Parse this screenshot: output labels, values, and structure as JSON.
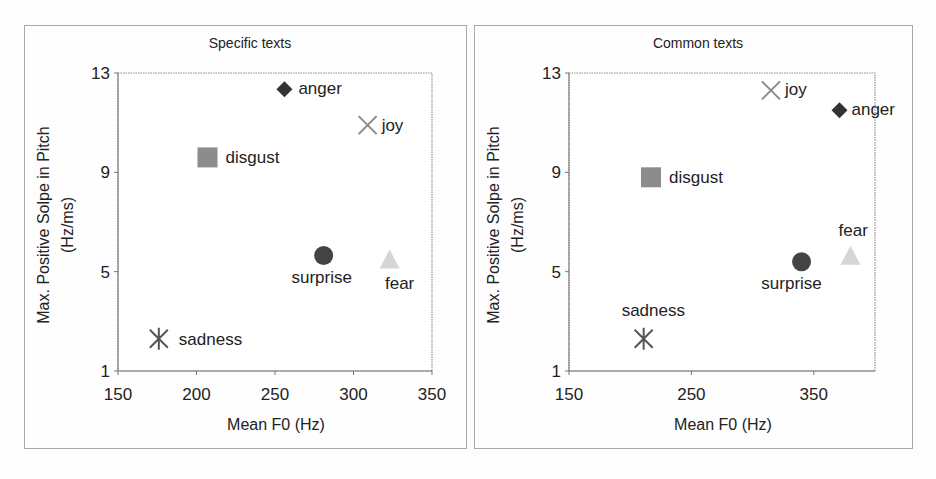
{
  "chart_data": [
    {
      "type": "scatter",
      "title": "Specific texts",
      "xlabel": "Mean F0 (Hz)",
      "ylabel": "Max. Positive Solpe in Pitch (Hz/ms)",
      "ylabel_lines": [
        "Max. Positive Solpe in Pitch",
        "(Hz/ms)"
      ],
      "xlim": [
        150,
        350
      ],
      "ylim": [
        1,
        13
      ],
      "xticks": [
        150,
        200,
        250,
        300,
        350
      ],
      "yticks": [
        1,
        5,
        9,
        13
      ],
      "grid": false,
      "legend": "none (points labeled directly)",
      "points": [
        {
          "label": "anger",
          "x": 256,
          "y": 12.35,
          "marker": "diamond",
          "color": "#333333"
        },
        {
          "label": "joy",
          "x": 309,
          "y": 10.9,
          "marker": "x",
          "color": "#8a8a8a"
        },
        {
          "label": "disgust",
          "x": 207,
          "y": 9.6,
          "marker": "square",
          "color": "#8c8c8c"
        },
        {
          "label": "surprise",
          "x": 281,
          "y": 5.65,
          "marker": "circle",
          "color": "#444444"
        },
        {
          "label": "fear",
          "x": 323,
          "y": 5.45,
          "marker": "triangle",
          "color": "#d6d6d6"
        },
        {
          "label": "sadness",
          "x": 176,
          "y": 2.3,
          "marker": "asterisk",
          "color": "#555555"
        }
      ]
    },
    {
      "type": "scatter",
      "title": "Common texts",
      "xlabel": "Mean F0 (Hz)",
      "ylabel": "Max. Positive Solpe in Pitch (Hz/ms)",
      "ylabel_lines": [
        "Max. Positive Solpe in Pitch",
        "(Hz/ms)"
      ],
      "xlim": [
        150,
        400
      ],
      "ylim": [
        1,
        13
      ],
      "xticks": [
        150,
        250,
        350
      ],
      "yticks": [
        1,
        5,
        9,
        13
      ],
      "grid": false,
      "legend": "none (points labeled directly)",
      "points": [
        {
          "label": "joy",
          "x": 315,
          "y": 12.3,
          "marker": "x",
          "color": "#8a8a8a"
        },
        {
          "label": "anger",
          "x": 371,
          "y": 11.5,
          "marker": "diamond",
          "color": "#333333"
        },
        {
          "label": "disgust",
          "x": 217,
          "y": 8.8,
          "marker": "square",
          "color": "#8c8c8c"
        },
        {
          "label": "surprise",
          "x": 340,
          "y": 5.4,
          "marker": "circle",
          "color": "#444444"
        },
        {
          "label": "fear",
          "x": 380,
          "y": 5.6,
          "marker": "triangle",
          "color": "#d6d6d6"
        },
        {
          "label": "sadness",
          "x": 211,
          "y": 2.3,
          "marker": "asterisk",
          "color": "#555555"
        }
      ]
    }
  ]
}
